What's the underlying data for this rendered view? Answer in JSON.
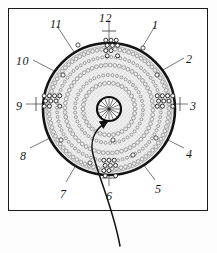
{
  "figure": {
    "type": "labeled-circular-cross-section",
    "background_color": "#ffffff",
    "frame_color": "#1b1b1b",
    "outline_color": "#141414",
    "fill_color": "#eeeeee",
    "ring_color": "#8c8c8c",
    "leader_color": "#666666",
    "pointer_color": "#121212"
  },
  "labels": [
    {
      "id": "label-12",
      "text": "12",
      "x": 99,
      "y": 12
    },
    {
      "id": "label-1",
      "text": "1",
      "x": 152,
      "y": 19
    },
    {
      "id": "label-2",
      "text": "2",
      "x": 186,
      "y": 53
    },
    {
      "id": "label-3",
      "text": "3",
      "x": 190,
      "y": 100
    },
    {
      "id": "label-4",
      "text": "4",
      "x": 186,
      "y": 148
    },
    {
      "id": "label-5",
      "text": "5",
      "x": 155,
      "y": 183
    },
    {
      "id": "label-6",
      "text": "6",
      "x": 106,
      "y": 190
    },
    {
      "id": "label-7",
      "text": "7",
      "x": 60,
      "y": 188
    },
    {
      "id": "label-8",
      "text": "8",
      "x": 20,
      "y": 150
    },
    {
      "id": "label-9",
      "text": "9",
      "x": 16,
      "y": 100
    },
    {
      "id": "label-10",
      "text": "10",
      "x": 16,
      "y": 55
    },
    {
      "id": "label-11",
      "text": "11",
      "x": 50,
      "y": 18
    }
  ],
  "geometry": {
    "center_x": 109,
    "center_y": 109,
    "outer_radius": 66,
    "hub_radius": 12,
    "hub_spokes": 16,
    "ring_radii": [
      26,
      34,
      44,
      52,
      60
    ],
    "leader_lines": 12
  },
  "pointer": {
    "name": "curved-pointer-arrow",
    "path": "M 120 246 C 114 212, 100 180, 94 158 C 88 140, 96 128, 108 121",
    "arrow_tip_x": 108,
    "arrow_tip_y": 121
  },
  "clusters": [
    {
      "id": "cluster-top",
      "cx": 111,
      "cy": 48,
      "cols": 3,
      "rows": 4
    },
    {
      "id": "cluster-bottom",
      "cx": 109,
      "cy": 168,
      "cols": 3,
      "rows": 4
    },
    {
      "id": "cluster-left",
      "cx": 52,
      "cy": 101,
      "cols": 4,
      "rows": 3
    },
    {
      "id": "cluster-right",
      "cx": 165,
      "cy": 101,
      "cols": 4,
      "rows": 3
    }
  ],
  "scattered_dots": [
    {
      "cx": 78,
      "cy": 45
    },
    {
      "cx": 143,
      "cy": 48
    },
    {
      "cx": 63,
      "cy": 75
    },
    {
      "cx": 157,
      "cy": 75
    },
    {
      "cx": 61,
      "cy": 140
    },
    {
      "cx": 156,
      "cy": 138
    },
    {
      "cx": 90,
      "cy": 163
    },
    {
      "cx": 133,
      "cy": 155
    },
    {
      "cx": 113,
      "cy": 140
    }
  ]
}
